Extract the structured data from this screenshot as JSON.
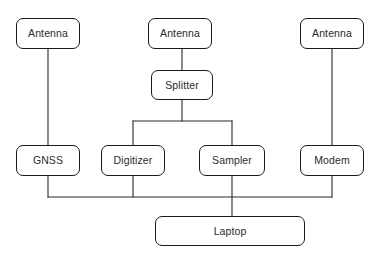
{
  "diagram": {
    "type": "block-diagram",
    "title": "",
    "canvas": {
      "width": 380,
      "height": 260,
      "background": "#ffffff"
    },
    "style": {
      "node_stroke": "#1a1a1a",
      "node_fill": "#ffffff",
      "node_stroke_width": 1.6,
      "node_corner_radius": 7,
      "edge_stroke": "#2b2b2b",
      "edge_stroke_width": 1.1,
      "label_color": "#2b2b2b",
      "label_size_px": 10.5
    },
    "nodes": [
      {
        "id": "antenna_left",
        "label": "Antenna",
        "x": 16,
        "y": 18,
        "w": 64,
        "h": 31
      },
      {
        "id": "antenna_mid",
        "label": "Antenna",
        "x": 148,
        "y": 18,
        "w": 64,
        "h": 31
      },
      {
        "id": "antenna_right",
        "label": "Antenna",
        "x": 300,
        "y": 18,
        "w": 64,
        "h": 31
      },
      {
        "id": "splitter",
        "label": "Splitter",
        "x": 151,
        "y": 70,
        "w": 62,
        "h": 30
      },
      {
        "id": "gnss",
        "label": "GNSS",
        "x": 16,
        "y": 145,
        "w": 64,
        "h": 31
      },
      {
        "id": "digitizer",
        "label": "Digitizer",
        "x": 101,
        "y": 145,
        "w": 64,
        "h": 31
      },
      {
        "id": "sampler",
        "label": "Sampler",
        "x": 199,
        "y": 145,
        "w": 66,
        "h": 31
      },
      {
        "id": "modem",
        "label": "Modem",
        "x": 300,
        "y": 145,
        "w": 64,
        "h": 31
      },
      {
        "id": "laptop",
        "label": "Laptop",
        "x": 155,
        "y": 216,
        "w": 150,
        "h": 30
      }
    ],
    "edges": [
      {
        "id": "edge-antenna-left-gnss",
        "from": "antenna_left",
        "to": "gnss",
        "path": "M 48 49 L 48 145"
      },
      {
        "id": "edge-antenna-mid-splitter",
        "from": "antenna_mid",
        "to": "splitter",
        "path": "M 182 49 L 182 70"
      },
      {
        "id": "edge-antenna-right-modem",
        "from": "antenna_right",
        "to": "modem",
        "path": "M 332 49 L 332 145"
      },
      {
        "id": "edge-splitter-branch-stem",
        "from": "splitter",
        "to": "branch-bar",
        "path": "M 182 100 L 182 121"
      },
      {
        "id": "edge-splitter-branch-bar",
        "from": "branch-bar",
        "to": "branch-bar",
        "path": "M 133 121 L 232 121"
      },
      {
        "id": "edge-branch-digitizer",
        "from": "branch-bar",
        "to": "digitizer",
        "path": "M 133 121 L 133 145"
      },
      {
        "id": "edge-branch-sampler",
        "from": "branch-bar",
        "to": "sampler",
        "path": "M 232 121 L 232 145"
      },
      {
        "id": "edge-gnss-bus",
        "from": "gnss",
        "to": "bus",
        "path": "M 48 176 L 48 197"
      },
      {
        "id": "edge-digitizer-bus",
        "from": "digitizer",
        "to": "bus",
        "path": "M 133 176 L 133 197"
      },
      {
        "id": "edge-modem-bus",
        "from": "modem",
        "to": "bus",
        "path": "M 332 176 L 332 197"
      },
      {
        "id": "edge-bus-bar",
        "from": "bus",
        "to": "bus",
        "path": "M 48 197 L 332 197"
      },
      {
        "id": "edge-sampler-laptop",
        "from": "sampler",
        "to": "laptop",
        "path": "M 232 176 L 232 216"
      }
    ]
  }
}
